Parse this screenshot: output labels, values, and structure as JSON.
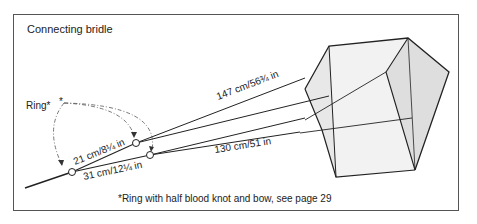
{
  "figure": {
    "title": "Connecting bridle",
    "ring_label": "Ring*",
    "ring_marker": "*",
    "footnote": "*Ring with half blood knot and bow, see page 29"
  },
  "measurements": {
    "upper_long_lines": "147 cm/56¾ in",
    "lower_long_lines": "130 cm/51 in",
    "upper_short_segment": "21 cm/8¼ in",
    "lower_short_segment": "31 cm/12¼ in"
  },
  "colors": {
    "line": "#222222",
    "frame": "#555555",
    "kite_shade_light": "#efefef",
    "kite_shade_mid": "#dcdcdc"
  }
}
